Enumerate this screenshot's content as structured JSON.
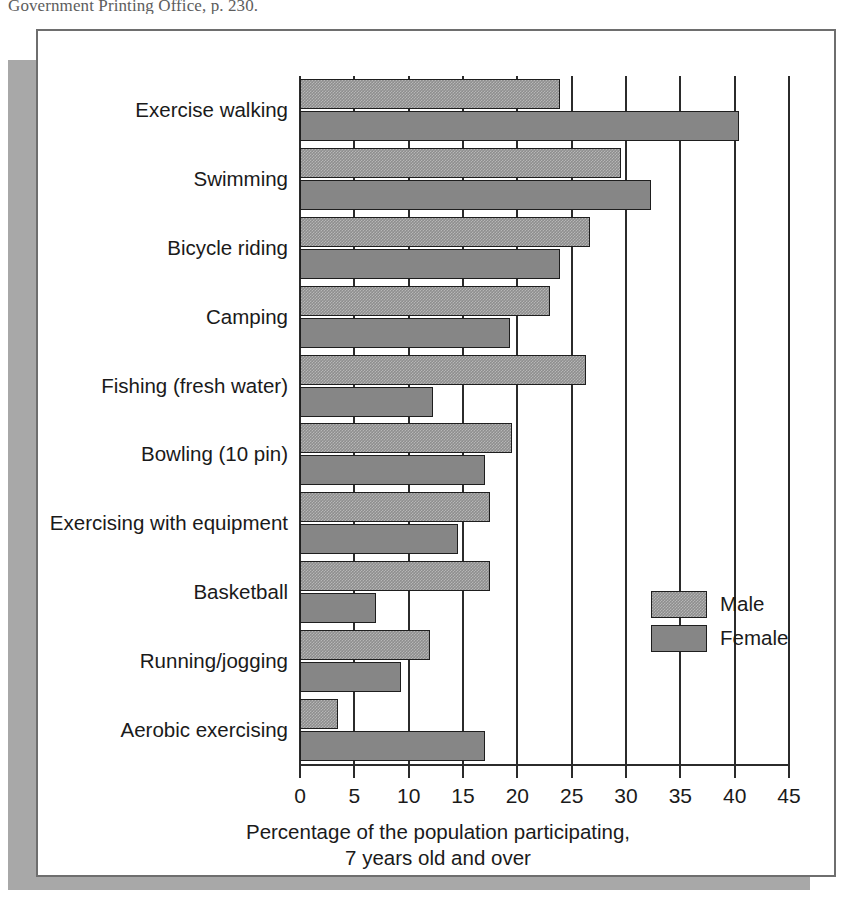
{
  "page_caption": "Government Printing Office, p. 230.",
  "chart_data": {
    "type": "bar",
    "orientation": "horizontal",
    "title": "",
    "xlabel_line1": "Percentage of the population participating,",
    "xlabel_line2": "7 years old and over",
    "ylabel": "",
    "xlim": [
      0,
      45
    ],
    "xticks": [
      "0",
      "5",
      "10",
      "15",
      "20",
      "25",
      "30",
      "35",
      "40",
      "45"
    ],
    "xtick_values": [
      0,
      5,
      10,
      15,
      20,
      25,
      30,
      35,
      40,
      45
    ],
    "grid": true,
    "legend_position": "center-right",
    "categories": [
      "Exercise walking",
      "Swimming",
      "Bicycle riding",
      "Camping",
      "Fishing (fresh water)",
      "Bowling (10 pin)",
      "Exercising with equipment",
      "Basketball",
      "Running/jogging",
      "Aerobic exercising"
    ],
    "series": [
      {
        "name": "Male",
        "color": "#8e8e8e",
        "values": [
          23.9,
          29.5,
          26.7,
          23.0,
          26.3,
          19.5,
          17.5,
          17.5,
          12.0,
          3.5
        ]
      },
      {
        "name": "Female",
        "color": "#868686",
        "values": [
          40.4,
          32.3,
          23.9,
          19.3,
          12.2,
          17.0,
          14.5,
          7.0,
          9.3,
          17.0
        ]
      }
    ]
  },
  "legend": {
    "entries": [
      {
        "label": "Male"
      },
      {
        "label": "Female"
      }
    ]
  }
}
